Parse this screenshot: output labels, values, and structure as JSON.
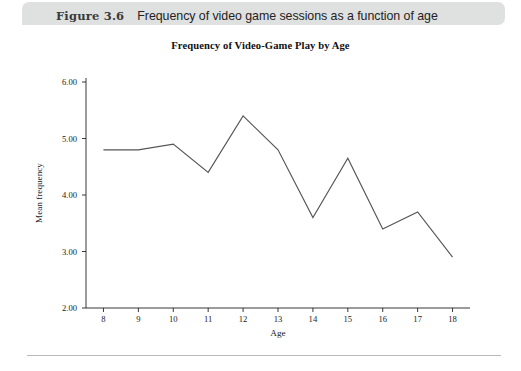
{
  "figure": {
    "number": "Figure 3.6",
    "caption": "Frequency of video game sessions as a function of age"
  },
  "colors": {
    "caption_band": "#dfe0e0",
    "line": "#555555",
    "axis": "#222222",
    "rule": "#b9b9b9"
  },
  "chart_data": {
    "type": "line",
    "title": "Frequency of Video-Game Play by Age",
    "xlabel": "Age",
    "ylabel": "Mean frequency",
    "x": [
      8,
      9,
      10,
      11,
      12,
      13,
      14,
      15,
      16,
      17,
      18
    ],
    "categories": [
      "8",
      "9",
      "10",
      "11",
      "12",
      "13",
      "14",
      "15",
      "16",
      "17",
      "18"
    ],
    "values": [
      4.8,
      4.8,
      4.9,
      4.4,
      5.4,
      4.8,
      3.6,
      4.65,
      3.4,
      3.7,
      2.9
    ],
    "series": [
      {
        "name": "Mean frequency",
        "values": [
          4.8,
          4.8,
          4.9,
          4.4,
          5.4,
          4.8,
          3.6,
          4.65,
          3.4,
          3.7,
          2.9
        ]
      }
    ],
    "xlim": [
      7.5,
      18.5
    ],
    "ylim": [
      2.0,
      6.0
    ],
    "ytick_labels": [
      "6.00",
      "5.00",
      "4.00",
      "3.00",
      "2.00"
    ],
    "ytick_values": [
      6.0,
      5.0,
      4.0,
      3.0,
      2.0
    ],
    "xtick_labels": [
      "8",
      "9",
      "10",
      "11",
      "12",
      "13",
      "14",
      "15",
      "16",
      "17",
      "18"
    ],
    "grid": false,
    "legend": false,
    "legend_position": "none",
    "markers": false
  }
}
